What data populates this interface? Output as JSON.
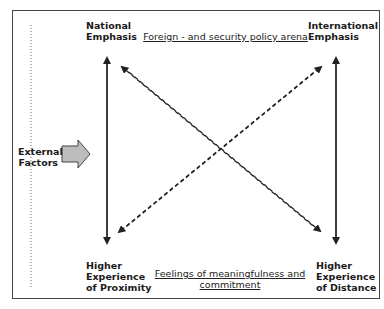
{
  "diagram": {
    "corners": {
      "top_left": [
        "National",
        "Emphasis"
      ],
      "top_right": [
        "International",
        "Emphasis"
      ],
      "bottom_left": [
        "Higher",
        "Experience",
        "of Proximity"
      ],
      "bottom_right": [
        "Higher",
        "Experience",
        "of Distance"
      ]
    },
    "top_caption": "Foreign - and security policy arena",
    "bottom_caption": [
      "Feelings of meaningfulness and",
      "commitment"
    ],
    "side_label": [
      "External",
      "Factors"
    ],
    "arrows": {
      "vertical_left": "bidirectional solid",
      "vertical_right": "bidirectional solid",
      "diagonals": "two bidirectional dashed crossing arrows"
    },
    "colors": {
      "frame": "#444444",
      "arrow": "#222222",
      "side_arrow_fill": "#bdbdbd",
      "dotted_line": "#888888"
    }
  }
}
